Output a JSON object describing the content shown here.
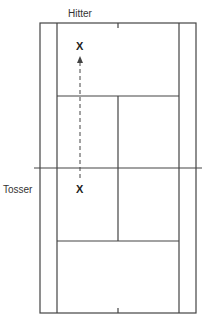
{
  "labels": {
    "hitter": "Hitter",
    "tosser": "Tosser"
  },
  "markers": {
    "hitter_position": "X",
    "tosser_position": "X"
  },
  "colors": {
    "line": "#444444",
    "background": "#ffffff"
  },
  "court": {
    "orientation": "vertical",
    "elements": [
      "doubles sidelines",
      "singles sidelines",
      "baselines",
      "service lines",
      "center service line",
      "net",
      "center marks"
    ]
  }
}
